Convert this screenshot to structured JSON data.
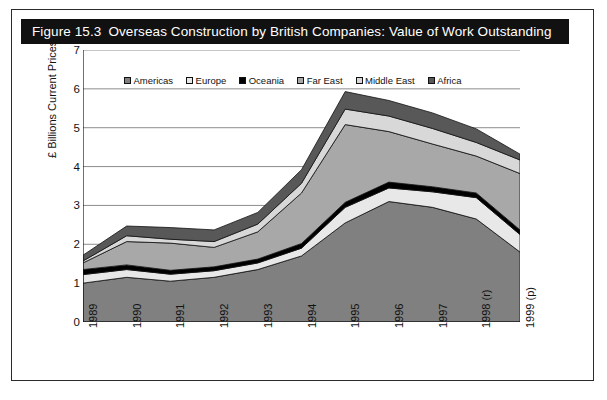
{
  "figure": {
    "number": "Figure 15.3",
    "title": "Overseas Construction by British Companies: Value of Work Outstanding"
  },
  "colors": {
    "americas": "#808080",
    "europe": "#e8e8e8",
    "oceania": "#000000",
    "far_east": "#a8a8a8",
    "middle_east": "#d8d8d8",
    "africa": "#585858",
    "title_bar": "#111111",
    "frame": "#2b2b2b",
    "gridline": "#808080"
  },
  "chart_data": {
    "type": "area",
    "title": "Overseas Construction by British Companies: Value of Work Outstanding",
    "xlabel": "",
    "ylabel": "£ Billions Current Prices",
    "ylim": [
      0,
      7
    ],
    "yticks": [
      0,
      1,
      2,
      3,
      4,
      5,
      6,
      7
    ],
    "grid": true,
    "legend_position": "top-center",
    "stacked": true,
    "categories": [
      "1989",
      "1990",
      "1991",
      "1992",
      "1993",
      "1994",
      "1995",
      "1996",
      "1997",
      "1998 (r)",
      "1999 (p)"
    ],
    "series": [
      {
        "name": "Americas",
        "values": [
          1.0,
          1.15,
          1.05,
          1.15,
          1.35,
          1.7,
          2.55,
          3.1,
          2.95,
          2.65,
          1.8
        ]
      },
      {
        "name": "Europe",
        "values": [
          0.22,
          0.2,
          0.18,
          0.17,
          0.17,
          0.2,
          0.4,
          0.35,
          0.4,
          0.55,
          0.45
        ]
      },
      {
        "name": "Oceania",
        "values": [
          0.13,
          0.12,
          0.1,
          0.1,
          0.1,
          0.12,
          0.13,
          0.15,
          0.13,
          0.12,
          0.12
        ]
      },
      {
        "name": "Far East",
        "values": [
          0.17,
          0.6,
          0.7,
          0.5,
          0.7,
          1.3,
          2.0,
          1.3,
          1.1,
          0.95,
          1.45
        ]
      },
      {
        "name": "Middle East",
        "values": [
          0.05,
          0.15,
          0.1,
          0.15,
          0.2,
          0.25,
          0.4,
          0.4,
          0.4,
          0.35,
          0.35
        ]
      },
      {
        "name": "Africa",
        "values": [
          0.15,
          0.25,
          0.3,
          0.3,
          0.3,
          0.35,
          0.45,
          0.4,
          0.4,
          0.35,
          0.15
        ]
      }
    ]
  },
  "legend": {
    "items": [
      {
        "label": "Americas",
        "swatch": "americas"
      },
      {
        "label": "Europe",
        "swatch": "europe"
      },
      {
        "label": "Oceania",
        "swatch": "oceania"
      },
      {
        "label": "Far East",
        "swatch": "far_east"
      },
      {
        "label": "Middle East",
        "swatch": "middle_east"
      },
      {
        "label": "Africa",
        "swatch": "africa"
      }
    ]
  }
}
